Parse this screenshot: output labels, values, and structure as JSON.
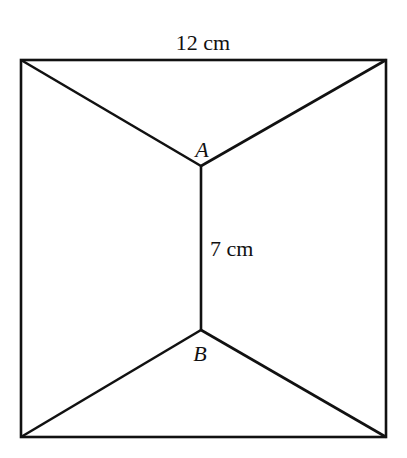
{
  "diagram": {
    "type": "geometry-figure",
    "labels": {
      "top_dimension": "12 cm",
      "middle_dimension": "7 cm",
      "point_a": "A",
      "point_b": "B"
    },
    "stroke_color": "#111111",
    "background_color": "#ffffff"
  }
}
